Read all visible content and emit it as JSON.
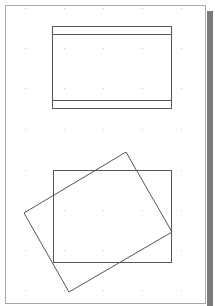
{
  "canvas": {
    "page": {
      "x": 5,
      "y": 5,
      "width": 201,
      "height": 299,
      "border_color": "#a8a8a8"
    },
    "shadow_color": "#7a7a7a",
    "grid": {
      "dot_color": "#c8c8c8",
      "xs": [
        25,
        64,
        103,
        142,
        181
      ],
      "ys": [
        8,
        48,
        88,
        129,
        170,
        210,
        250,
        290
      ]
    },
    "shapes": [
      {
        "type": "rect",
        "name": "top-rectangle",
        "x": 52,
        "y": 26,
        "width": 119,
        "height": 82,
        "stroke": "#555555"
      },
      {
        "type": "line",
        "name": "top-rectangle-upper-band",
        "x1": 52,
        "y1": 34,
        "x2": 171,
        "y2": 34,
        "stroke": "#555555"
      },
      {
        "type": "line",
        "name": "top-rectangle-lower-band",
        "x1": 52,
        "y1": 100,
        "x2": 171,
        "y2": 100,
        "stroke": "#555555"
      },
      {
        "type": "rect",
        "name": "bottom-rectangle",
        "x": 53,
        "y": 170,
        "width": 118,
        "height": 92,
        "stroke": "#555555"
      },
      {
        "type": "polygon",
        "name": "rotated-rectangle",
        "points": "126,152 172,232 69,292 24,213",
        "stroke": "#555555"
      }
    ]
  }
}
